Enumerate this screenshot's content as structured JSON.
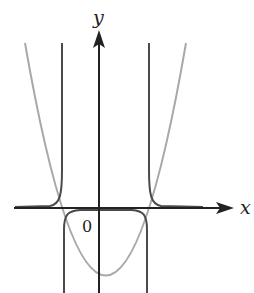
{
  "diagram": {
    "type": "function-graph",
    "axes": {
      "x_label": "x",
      "y_label": "y",
      "origin_label": "0"
    },
    "curves": [
      {
        "name": "parabola",
        "description": "upward-opening parabola with negative y-intercept",
        "color": "#a8a8a8"
      },
      {
        "name": "reciprocal-of-parabola",
        "description": "curve with vertical asymptotes at the parabola's x-intercepts; approaches x-axis from above outside, and from below between asymptotes",
        "color": "#4a4a4a"
      }
    ],
    "colors": {
      "axis": "#222222",
      "parabola": "#a8a8a8",
      "reciprocal": "#4a4a4a"
    }
  }
}
